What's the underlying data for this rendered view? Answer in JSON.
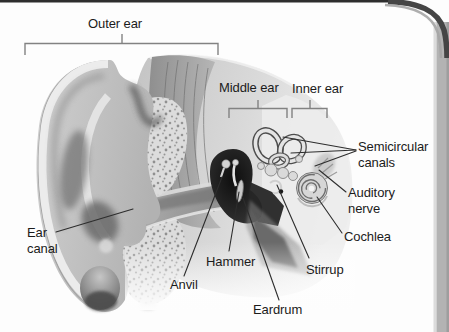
{
  "labels": {
    "outer_ear": "Outer ear",
    "middle_ear": "Middle ear",
    "inner_ear": "Inner ear",
    "ear_canal": "Ear canal",
    "hammer": "Hammer",
    "anvil": "Anvil",
    "eardrum": "Eardrum",
    "stirrup": "Stirrup",
    "cochlea": "Cochlea",
    "auditory_nerve": "Auditory nerve",
    "semicircular_canals": "Semicircular canals"
  },
  "colors": {
    "page_background": "#fdfdfd",
    "frame_top_border": "#2e2e2e",
    "frame_side_band": "#b3b3b3",
    "label_text": "#1b1b1b",
    "leader_line": "#2d2d2d",
    "bracket_line": "#828282"
  }
}
